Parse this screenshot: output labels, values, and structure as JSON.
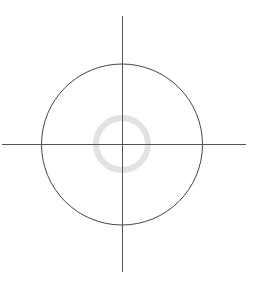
{
  "canvas": {
    "width": 257,
    "height": 284,
    "background": "#ffffff"
  },
  "colors": {
    "axis_line": "#555555",
    "outer_circle": "#444444",
    "inner_ring": "#e2e2e2"
  },
  "crosshair": {
    "center": {
      "x": 122,
      "y": 144
    },
    "horizontal_line": {
      "x1": 2,
      "y1": 144,
      "x2": 246,
      "y2": 144,
      "stroke_width": 1
    },
    "vertical_line": {
      "x1": 122,
      "y1": 16,
      "x2": 122,
      "y2": 272,
      "stroke_width": 1
    }
  },
  "outer_circle": {
    "cx": 122,
    "cy": 144.5,
    "r": 80.5,
    "stroke_width": 1
  },
  "inner_ring": {
    "cx": 122,
    "cy": 144,
    "r": 26,
    "stroke_width": 6
  }
}
